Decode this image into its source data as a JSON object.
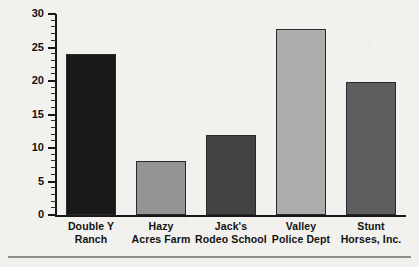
{
  "chart_data": {
    "type": "bar",
    "title": "",
    "xlabel": "",
    "ylabel": "",
    "ylim": [
      0,
      30
    ],
    "y_major_ticks": [
      0,
      5,
      10,
      15,
      20,
      25,
      30
    ],
    "y_minor_tick_step": 1,
    "grid": false,
    "legend": "none",
    "categories": [
      "Double Y Ranch",
      "Hazy Acres Farm",
      "Jack's Rodeo School",
      "Valley Police Dept",
      "Stunt Horses, Inc."
    ],
    "category_lines": [
      [
        "Double Y",
        "Ranch"
      ],
      [
        "Hazy",
        "Acres Farm"
      ],
      [
        "Jack's",
        "Rodeo School"
      ],
      [
        "Valley",
        "Police Dept"
      ],
      [
        "Stunt",
        "Horses, Inc."
      ]
    ],
    "values": [
      24.0,
      8.0,
      12.0,
      27.7,
      19.8
    ],
    "bar_colors": [
      "#18181a",
      "#949494",
      "#434345",
      "#adadad",
      "#5e5e60"
    ]
  },
  "axis": {
    "tick_labels": [
      "0",
      "5",
      "10",
      "15",
      "20",
      "25",
      "30"
    ]
  },
  "colors": {
    "background": "#f2f1ee",
    "axis": "#17171a",
    "text": "#111111",
    "rule": "#8e8e8e"
  }
}
